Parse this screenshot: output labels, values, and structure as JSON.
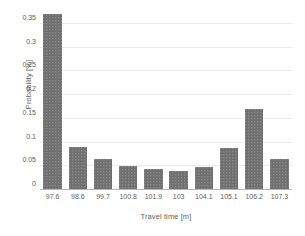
{
  "chart_data": {
    "type": "bar",
    "title": "",
    "xlabel": "Travel time [m]",
    "ylabel": "Probability [%]",
    "categories": [
      "97.6",
      "98.6",
      "99.7",
      "100.8",
      "101.9",
      "103",
      "104.1",
      "105.1",
      "106.2",
      "107.3"
    ],
    "values": [
      0.37,
      0.088,
      0.063,
      0.049,
      0.042,
      0.039,
      0.047,
      0.086,
      0.17,
      0.064
    ],
    "ylim": [
      0,
      0.375
    ],
    "yticks": [
      "0",
      "0.05",
      "0.1",
      "0.15",
      "0.2",
      "0.25",
      "0.3",
      "0.35"
    ],
    "ytick_values": [
      0,
      0.05,
      0.1,
      0.15,
      0.2,
      0.25,
      0.3,
      0.35
    ],
    "grid": true,
    "legend": "none",
    "bar_color": "#6f6f6f",
    "grid_color": "#eceaea",
    "axis_color": "#b6b6b6",
    "text_color": "#5e5e5e"
  }
}
